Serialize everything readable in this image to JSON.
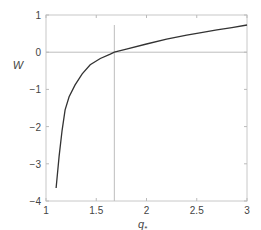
{
  "chart_data": {
    "type": "line",
    "title": "",
    "xlabel": "q",
    "xlabel_subscript": "*",
    "ylabel": "W",
    "xlim": [
      1,
      3
    ],
    "ylim": [
      -4,
      1
    ],
    "xticks": [
      1,
      1.5,
      2,
      2.5,
      3
    ],
    "xtick_labels": [
      "1",
      "1.5",
      "2",
      "2.5",
      "3"
    ],
    "yticks": [
      1,
      0,
      -1,
      -2,
      -3,
      -4
    ],
    "ytick_labels": [
      "1",
      "0",
      "−1",
      "−2",
      "−3",
      "−4"
    ],
    "grid": false,
    "legend": null,
    "reference_lines": {
      "horizontal_y": 0,
      "vertical_x": 1.68
    },
    "series": [
      {
        "name": "W(q*)",
        "color": "#333333",
        "x": [
          1.1,
          1.13,
          1.16,
          1.19,
          1.23,
          1.29,
          1.36,
          1.44,
          1.54,
          1.64,
          1.68,
          1.8,
          2.0,
          2.2,
          2.4,
          2.53,
          2.7,
          2.85,
          3.0
        ],
        "y": [
          -3.65,
          -2.8,
          -2.1,
          -1.55,
          -1.2,
          -0.88,
          -0.58,
          -0.34,
          -0.17,
          -0.05,
          0.0,
          0.08,
          0.22,
          0.35,
          0.46,
          0.52,
          0.6,
          0.66,
          0.73
        ]
      }
    ]
  }
}
